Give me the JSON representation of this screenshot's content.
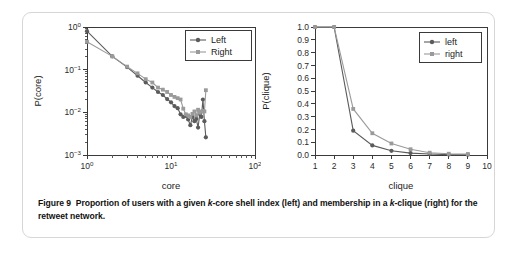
{
  "figure": {
    "caption_label": "Figure 9",
    "caption_part1": "Proportion of users with a given ",
    "caption_k1": "k",
    "caption_part2": "-core shell index (left) and membership in a ",
    "caption_k2": "k",
    "caption_part3": "-clique (right) for the retweet network."
  },
  "colors": {
    "left_series": "#5b5b5b",
    "right_series": "#9a9a9a",
    "axis": "#3a3a3a",
    "card_border": "#d6d6d6",
    "background": "#ffffff",
    "text": "#1c1c1c"
  },
  "chart_data": [
    {
      "id": "core",
      "type": "scatter",
      "title": "",
      "xlabel": "core",
      "ylabel": "P(core)",
      "xscale": "log",
      "yscale": "log",
      "xlim": [
        1,
        100
      ],
      "ylim": [
        0.001,
        1
      ],
      "grid": false,
      "legend_position": "top-right",
      "xtick_labels": [
        "10^0",
        "10^1",
        "10^2"
      ],
      "xtick_values": [
        1,
        10,
        100
      ],
      "ytick_labels": [
        "10^0",
        "10^-1",
        "10^-2",
        "10^-3"
      ],
      "ytick_values": [
        1,
        0.1,
        0.01,
        0.001
      ],
      "series": [
        {
          "name": "Left",
          "marker": "circle",
          "color": "#5b5b5b",
          "x": [
            1,
            2,
            3,
            4,
            5,
            6,
            7,
            8,
            9,
            10,
            11,
            12,
            13,
            14,
            15,
            16,
            17,
            18,
            19,
            20,
            21,
            22,
            23,
            24,
            25,
            26
          ],
          "y": [
            0.8,
            0.205,
            0.115,
            0.072,
            0.05,
            0.038,
            0.03,
            0.0255,
            0.0205,
            0.0172,
            0.014,
            0.0125,
            0.009,
            0.0078,
            0.0082,
            0.0068,
            0.005,
            0.0078,
            0.0062,
            0.007,
            0.0044,
            0.0092,
            0.0078,
            0.02,
            0.0062,
            0.0026
          ]
        },
        {
          "name": "Right",
          "marker": "square",
          "color": "#9a9a9a",
          "x": [
            1,
            2,
            3,
            4,
            5,
            6,
            7,
            8,
            9,
            10,
            11,
            12,
            13,
            14,
            15,
            16,
            17,
            18,
            19,
            20,
            21,
            22,
            23,
            24,
            25,
            26
          ],
          "y": [
            0.45,
            0.205,
            0.118,
            0.082,
            0.06,
            0.05,
            0.038,
            0.034,
            0.03,
            0.0255,
            0.023,
            0.0215,
            0.02,
            0.0122,
            0.009,
            0.0085,
            0.0078,
            0.0092,
            0.0105,
            0.0085,
            0.0115,
            0.0098,
            0.0105,
            0.0108,
            0.0105,
            0.033
          ]
        }
      ]
    },
    {
      "id": "clique",
      "type": "line",
      "title": "",
      "xlabel": "clique",
      "ylabel": "P(clique)",
      "xscale": "linear",
      "yscale": "linear",
      "xlim": [
        1,
        10
      ],
      "ylim": [
        0,
        1
      ],
      "grid": false,
      "legend_position": "top-right",
      "xtick_labels": [
        "1",
        "2",
        "3",
        "4",
        "5",
        "6",
        "7",
        "8",
        "9",
        "10"
      ],
      "xtick_values": [
        1,
        2,
        3,
        4,
        5,
        6,
        7,
        8,
        9,
        10
      ],
      "ytick_labels": [
        "1.0",
        "0.9",
        "0.8",
        "0.7",
        "0.6",
        "0.5",
        "0.4",
        "0.3",
        "0.2",
        "0.1",
        "0.0"
      ],
      "ytick_values": [
        1.0,
        0.9,
        0.8,
        0.7,
        0.6,
        0.5,
        0.4,
        0.3,
        0.2,
        0.1,
        0.0
      ],
      "series": [
        {
          "name": "left",
          "marker": "circle",
          "color": "#5b5b5b",
          "x": [
            1,
            2,
            3,
            4,
            5,
            6,
            7,
            8,
            9
          ],
          "y": [
            1.0,
            1.0,
            0.19,
            0.075,
            0.033,
            0.015,
            0.008,
            0.003,
            0.002
          ]
        },
        {
          "name": "right",
          "marker": "square",
          "color": "#9a9a9a",
          "x": [
            1,
            2,
            3,
            4,
            5,
            6,
            7,
            8,
            9
          ],
          "y": [
            1.0,
            1.0,
            0.36,
            0.17,
            0.09,
            0.045,
            0.018,
            0.01,
            0.008
          ]
        }
      ]
    }
  ]
}
